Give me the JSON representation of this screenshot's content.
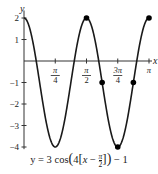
{
  "chart_data": {
    "type": "line",
    "xlabel": "x",
    "ylabel": "y",
    "xlim": [
      0,
      3.14159
    ],
    "ylim": [
      -4,
      2
    ],
    "x_ticks": [
      {
        "value": 0.7854,
        "num": "π",
        "den": "4"
      },
      {
        "value": 1.5708,
        "num": "π",
        "den": "2"
      },
      {
        "value": 2.3562,
        "num": "3π",
        "den": "4"
      },
      {
        "value": 3.1416,
        "label": "π"
      }
    ],
    "y_ticks": [
      2,
      1,
      -1,
      -2,
      -3,
      -4
    ],
    "grid": false,
    "series": [
      {
        "name": "y = 3cos(4[x − π/2]) − 1",
        "amplitude": 3,
        "b": 4,
        "phase_shift": 1.5708,
        "vertical_shift": -1,
        "key_points": [
          {
            "x": 0,
            "y": 2
          },
          {
            "x": 0.3927,
            "y": -1
          },
          {
            "x": 0.7854,
            "y": -4
          },
          {
            "x": 1.1781,
            "y": -1
          },
          {
            "x": 1.5708,
            "y": 2
          },
          {
            "x": 1.9635,
            "y": -1
          },
          {
            "x": 2.3562,
            "y": -4
          },
          {
            "x": 2.7489,
            "y": -1
          },
          {
            "x": 3.1416,
            "y": 2
          }
        ],
        "marked_points": [
          {
            "x": 1.5708,
            "y": 2
          },
          {
            "x": 1.9635,
            "y": -1
          },
          {
            "x": 2.3562,
            "y": -4
          },
          {
            "x": 2.7489,
            "y": -1
          },
          {
            "x": 3.1416,
            "y": 2
          }
        ]
      }
    ]
  },
  "caption": {
    "prefix": "y = 3 cos",
    "full": "y = 3 cos(4[x − π/2]) − 1"
  },
  "axis": {
    "x_label": "x",
    "y_label": "y"
  },
  "colors": {
    "curve": "#1a1a1a",
    "axis": "#333333",
    "point": "#000000"
  }
}
